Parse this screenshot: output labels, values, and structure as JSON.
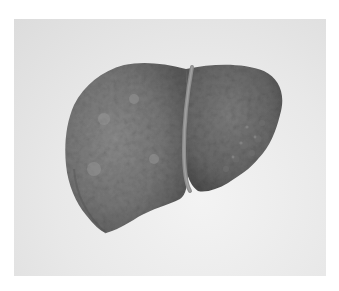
{
  "image": {
    "subject": "liver specimen",
    "description": "Photograph of an excised liver with a nodular, mottled surface and a ligament band dividing the lobes, on a light gray background",
    "colors": {
      "page_background": "#ffffff",
      "photo_background": "#e8e8e8",
      "liver_mid": "#7a7a7a",
      "liver_dark": "#555555",
      "liver_light": "#9a9a9a",
      "ligament": "#8c8c8c"
    }
  },
  "caption": {
    "text": ""
  }
}
